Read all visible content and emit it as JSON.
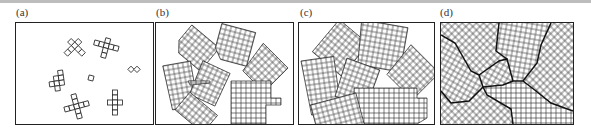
{
  "figure": {
    "panels": [
      {
        "id": "a",
        "label": "(a)",
        "description": "isolated small crystal nuclei"
      },
      {
        "id": "b",
        "label": "(b)",
        "description": "growing crystallites"
      },
      {
        "id": "c",
        "label": "(c)",
        "description": "crystallites nearly impinging"
      },
      {
        "id": "d",
        "label": "(d)",
        "description": "fully grown grains with grain boundaries"
      }
    ]
  },
  "colors": {
    "line": "#222222",
    "frame": "#222222",
    "rule": "#bdbdbd"
  }
}
